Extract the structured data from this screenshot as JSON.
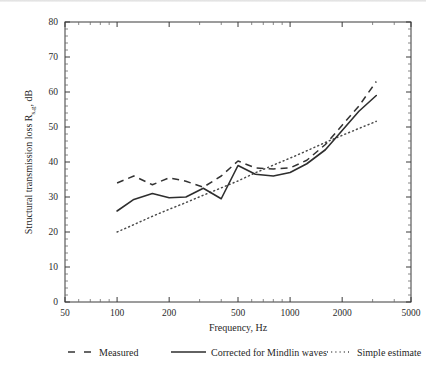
{
  "chart_data": {
    "type": "line",
    "title": "",
    "xlabel": "Frequency, Hz",
    "ylabel": "Structural transmission loss R",
    "ylabel_sub": "s,g",
    "ylabel_tail": ", dB",
    "xscale": "log",
    "xlim": [
      50,
      5000
    ],
    "ylim": [
      0,
      80
    ],
    "xticks": [
      50,
      100,
      200,
      500,
      1000,
      2000,
      5000
    ],
    "xticklabels": [
      "50",
      "100",
      "200",
      "500",
      "1000",
      "2000",
      "5000"
    ],
    "yticks": [
      0,
      10,
      20,
      30,
      40,
      50,
      60,
      70,
      80
    ],
    "yticklabels": [
      "0",
      "10",
      "20",
      "30",
      "40",
      "50",
      "60",
      "70",
      "80"
    ],
    "grid": false,
    "legend_position": "below-plot",
    "x": [
      100,
      125,
      160,
      200,
      250,
      315,
      400,
      500,
      630,
      800,
      1000,
      1250,
      1600,
      2000,
      2500,
      3150
    ],
    "series": [
      {
        "name": "Measured",
        "style": "dashed",
        "color": "#333333",
        "values": [
          34.0,
          36.0,
          33.5,
          35.5,
          34.5,
          32.8,
          36.0,
          40.3,
          38.3,
          38.0,
          38.3,
          40.5,
          45.0,
          50.5,
          56.0,
          63.0
        ]
      },
      {
        "name": "Corrected for Mindlin waves",
        "style": "solid",
        "color": "#2e2e2e",
        "values": [
          26.0,
          29.3,
          31.0,
          29.8,
          30.0,
          32.5,
          29.5,
          39.0,
          36.5,
          36.0,
          37.0,
          39.5,
          43.5,
          49.0,
          54.5,
          59.0
        ]
      },
      {
        "name": "Simple estimate",
        "style": "dotted",
        "color": "#4a4a4a",
        "values": [
          20.0,
          22.1,
          24.5,
          26.5,
          28.4,
          30.5,
          32.6,
          34.6,
          36.9,
          39.1,
          41.1,
          43.2,
          45.6,
          47.6,
          49.6,
          51.6
        ]
      }
    ]
  },
  "legend": {
    "items": [
      {
        "label": "Measured",
        "style": "dashed"
      },
      {
        "label": "Corrected for Mindlin waves",
        "style": "solid"
      },
      {
        "label": "Simple estimate",
        "style": "dotted"
      }
    ]
  }
}
